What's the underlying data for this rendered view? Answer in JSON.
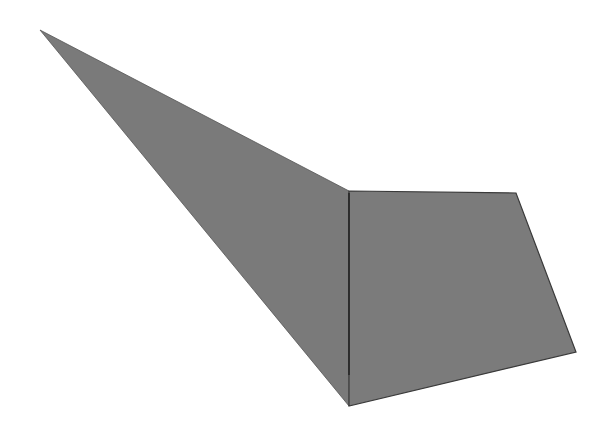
{
  "canvas": {
    "width": 612,
    "height": 434,
    "background": "#ffffff"
  },
  "shapes": {
    "triangle": {
      "label": "triangle",
      "points": [
        [
          40,
          30
        ],
        [
          349,
          191
        ],
        [
          349,
          406
        ]
      ],
      "fill": "#7a7a7a",
      "stroke": "#555555"
    },
    "quadrilateral": {
      "label": "quadrilateral",
      "points": [
        [
          349,
          191
        ],
        [
          516,
          193
        ],
        [
          576,
          352
        ],
        [
          349,
          406
        ]
      ],
      "fill": "#7b7b7b",
      "stroke": "#3a3a3a"
    },
    "shared_edge": {
      "label": "shared edge",
      "from": [
        349,
        193
      ],
      "to": [
        349,
        375
      ],
      "stroke": "#222222"
    }
  }
}
